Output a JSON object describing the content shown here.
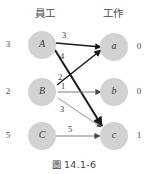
{
  "figure": {
    "caption_prefix": "圖",
    "caption_number": "14.1-6",
    "caption_full": "圖 14.1-6"
  },
  "columns": {
    "left_header": "員工",
    "right_header": "工作"
  },
  "colors": {
    "node_fill": "#d2d2d2",
    "edge_light": "#808080",
    "edge_dark": "#1a1a1a",
    "text": "#3a3a3a",
    "background": "#ffffff"
  },
  "nodes": {
    "left": [
      {
        "id": "A",
        "label": "A",
        "side_value": "3"
      },
      {
        "id": "B",
        "label": "B",
        "side_value": "2"
      },
      {
        "id": "C",
        "label": "C",
        "side_value": "5"
      }
    ],
    "right": [
      {
        "id": "a",
        "label": "a",
        "side_value": "0"
      },
      {
        "id": "b",
        "label": "b",
        "side_value": "0"
      },
      {
        "id": "c",
        "label": "c",
        "side_value": "1"
      }
    ]
  },
  "edges": [
    {
      "from": "A",
      "to": "a",
      "weight": "3",
      "style": "dark"
    },
    {
      "from": "A",
      "to": "c",
      "weight": "4",
      "style": "dark"
    },
    {
      "from": "B",
      "to": "a",
      "weight": "2",
      "style": "dark"
    },
    {
      "from": "B",
      "to": "b",
      "weight": "1",
      "style": "light"
    },
    {
      "from": "B",
      "to": "c",
      "weight": "3",
      "style": "light"
    },
    {
      "from": "C",
      "to": "c",
      "weight": "5",
      "style": "light"
    }
  ]
}
